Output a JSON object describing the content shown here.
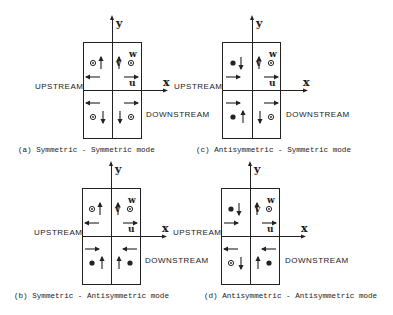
{
  "labels": {
    "upstream": "UPSTREAM",
    "downstream": "DOWNSTREAM",
    "x_axis": "x",
    "y_axis": "y",
    "u": "u",
    "v": "v",
    "w": "w"
  },
  "panels": [
    {
      "id": "a",
      "caption": "(a)  Symmetric - Symmetric mode",
      "quadrants": {
        "ul": {
          "w": "out",
          "v": "up",
          "u": "left"
        },
        "ur": {
          "w": "out",
          "v": "up",
          "u": "right"
        },
        "ll": {
          "w": "out",
          "v": "down",
          "u": "left"
        },
        "lr": {
          "w": "out",
          "v": "down",
          "u": "right"
        }
      }
    },
    {
      "id": "c",
      "caption": "(c)  Antisymmetric - Symmetric mode",
      "quadrants": {
        "ul": {
          "w": "in",
          "v": "down",
          "u": "right"
        },
        "ur": {
          "w": "out",
          "v": "up",
          "u": "right"
        },
        "ll": {
          "w": "in",
          "v": "up",
          "u": "right"
        },
        "lr": {
          "w": "out",
          "v": "down",
          "u": "right"
        }
      }
    },
    {
      "id": "b",
      "caption": "(b)  Symmetric - Antisymmetric mode",
      "quadrants": {
        "ul": {
          "w": "out",
          "v": "up",
          "u": "left"
        },
        "ur": {
          "w": "out",
          "v": "up",
          "u": "right"
        },
        "ll": {
          "w": "in",
          "v": "up",
          "u": "right"
        },
        "lr": {
          "w": "in",
          "v": "up",
          "u": "left"
        }
      }
    },
    {
      "id": "d",
      "caption": "(d)  Antisymmetric - Antisymmetric mode",
      "quadrants": {
        "ul": {
          "w": "in",
          "v": "down",
          "u": "right"
        },
        "ur": {
          "w": "out",
          "v": "up",
          "u": "right"
        },
        "ll": {
          "w": "out",
          "v": "down",
          "u": "left"
        },
        "lr": {
          "w": "in",
          "v": "up",
          "u": "left"
        }
      }
    }
  ]
}
